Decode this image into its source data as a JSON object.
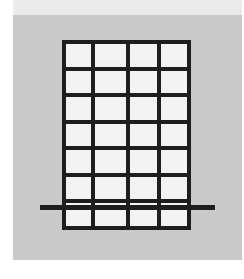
{
  "figure": {
    "grid": {
      "rows": 7,
      "columns": 4
    },
    "colors": {
      "background": "#ffffff",
      "top_band": "#ebebeb",
      "panel": "#c9c9c9",
      "lines": "#1e1e1e",
      "cells": "#f3f3f3"
    }
  }
}
